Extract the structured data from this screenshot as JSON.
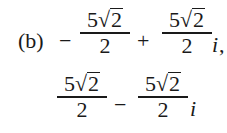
{
  "problem": {
    "label": "(b)",
    "answer1": {
      "sign1": "−",
      "term1": {
        "coef": "5",
        "radicand": "2",
        "denominator": "2"
      },
      "op": "+",
      "term2": {
        "coef": "5",
        "radicand": "2",
        "denominator": "2",
        "unit": "i"
      },
      "trail": ","
    },
    "answer2": {
      "term1": {
        "coef": "5",
        "radicand": "2",
        "denominator": "2"
      },
      "op": "−",
      "term2": {
        "coef": "5",
        "radicand": "2",
        "denominator": "2",
        "unit": "i"
      }
    },
    "radical_sign": "√"
  }
}
